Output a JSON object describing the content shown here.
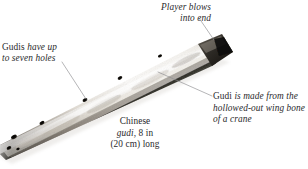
{
  "figure": {
    "background_color": "#ffffff",
    "text_color": "#29292b",
    "leader_line_color": "#8d8d8f"
  },
  "labels": {
    "blow": {
      "line1": "Player blows",
      "line2": "into end"
    },
    "holes": {
      "lead_word": "Gudis",
      "line1_rest": " have up",
      "line2": "to seven holes"
    },
    "bone": {
      "lead_word": "Gudi",
      "line1_rest": " is made from the",
      "line2": "hollowed-out wing bone",
      "line3": "of a crane"
    }
  },
  "caption": {
    "line1": "Chinese",
    "line2_italic": "gudi",
    "line2_rest": ", 8 in",
    "line3": "(20 cm) long"
  },
  "object": {
    "name": "gudi-flute",
    "material": "hollowed-out crane wing bone",
    "length_in": "8 in",
    "length_cm": "20 cm",
    "hole_count": "seven",
    "bone_light_color": "#f4f2ee",
    "bone_mid_color": "#cfc9c0",
    "bone_shadow_color": "#1d1c1a",
    "hole_color": "#141312"
  }
}
